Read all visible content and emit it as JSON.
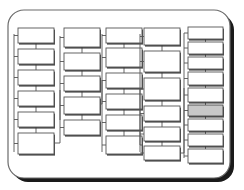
{
  "diagram": {
    "frame": {
      "name": "card-frame",
      "x": 8,
      "y": 10,
      "width": 222,
      "height": 168,
      "corner_radius": 16,
      "fill": "#ffffff",
      "stroke": "#6b6b6b",
      "stroke_width": 1.2,
      "shadow_color": "#1a1a1a",
      "shadow_offset_x": 4,
      "shadow_offset_y": 4
    },
    "style": {
      "box_fill": "#ffffff",
      "box_stroke": "#555555",
      "box_stroke_width": 0.9,
      "box_shadow": "#2b2b2b",
      "connector_stroke": "#555555",
      "connector_width": 0.9,
      "highlight_fill": "#c8c8c8",
      "highlight_stroke": "#4a4a4a"
    },
    "columns": [
      {
        "name": "column-1",
        "trunk": {
          "x": 14,
          "y_top": 34,
          "y_bottom": 152
        },
        "boxes": [
          {
            "id": "c1-b1",
            "x": 18,
            "y": 28,
            "w": 36,
            "h": 15,
            "highlight": false
          },
          {
            "id": "c1-b2",
            "x": 18,
            "y": 49,
            "w": 36,
            "h": 15,
            "highlight": false
          },
          {
            "id": "c1-b3",
            "x": 18,
            "y": 70,
            "w": 36,
            "h": 15,
            "highlight": false
          },
          {
            "id": "c1-b4",
            "x": 18,
            "y": 91,
            "w": 36,
            "h": 15,
            "highlight": false
          },
          {
            "id": "c1-b5",
            "x": 18,
            "y": 112,
            "w": 36,
            "h": 15,
            "highlight": false
          },
          {
            "id": "c1-b6",
            "x": 18,
            "y": 133,
            "w": 36,
            "h": 21,
            "highlight": false
          }
        ],
        "links": [
          {
            "from": "c1-b1",
            "to": "c1-b2"
          },
          {
            "from": "c1-b2",
            "to": "c1-b3"
          },
          {
            "from": "c1-b3",
            "to": "c1-b4"
          },
          {
            "from": "c1-b4",
            "to": "c1-b5"
          },
          {
            "from": "c1-b5",
            "to": "c1-b6"
          }
        ]
      },
      {
        "name": "column-2",
        "trunk": {
          "x": 60,
          "y_top": 36,
          "y_bottom": 120
        },
        "boxes": [
          {
            "id": "c2-b1",
            "x": 64,
            "y": 28,
            "w": 36,
            "h": 19,
            "highlight": false
          },
          {
            "id": "c2-b2",
            "x": 64,
            "y": 53,
            "w": 36,
            "h": 17,
            "highlight": false
          },
          {
            "id": "c2-b3",
            "x": 64,
            "y": 76,
            "w": 36,
            "h": 15,
            "highlight": false
          },
          {
            "id": "c2-b4",
            "x": 64,
            "y": 97,
            "w": 36,
            "h": 17,
            "highlight": false
          },
          {
            "id": "c2-b5",
            "x": 64,
            "y": 120,
            "w": 36,
            "h": 15,
            "highlight": false
          }
        ],
        "links": [
          {
            "from": "c2-b1",
            "to": "c2-b2"
          },
          {
            "from": "c2-b2",
            "to": "c2-b3"
          },
          {
            "from": "c2-b3",
            "to": "c2-b4"
          },
          {
            "from": "c2-b4",
            "to": "c2-b5"
          }
        ]
      },
      {
        "name": "column-3",
        "trunk": {
          "x": 102,
          "y_top": 34,
          "y_bottom": 152
        },
        "boxes": [
          {
            "id": "c3-b1",
            "x": 106,
            "y": 28,
            "w": 36,
            "h": 15,
            "highlight": false
          },
          {
            "id": "c3-b2",
            "x": 106,
            "y": 48,
            "w": 36,
            "h": 19,
            "highlight": false
          },
          {
            "id": "c3-b3",
            "x": 106,
            "y": 73,
            "w": 36,
            "h": 15,
            "highlight": false
          },
          {
            "id": "c3-b4",
            "x": 106,
            "y": 94,
            "w": 36,
            "h": 15,
            "highlight": false
          },
          {
            "id": "c3-b5",
            "x": 106,
            "y": 115,
            "w": 36,
            "h": 15,
            "highlight": false
          },
          {
            "id": "c3-b6",
            "x": 106,
            "y": 136,
            "w": 36,
            "h": 18,
            "highlight": false
          }
        ],
        "links": [
          {
            "from": "c3-b1",
            "to": "c3-b2"
          },
          {
            "from": "c3-b2",
            "to": "c3-b3"
          },
          {
            "from": "c3-b3",
            "to": "c3-b4"
          },
          {
            "from": "c3-b4",
            "to": "c3-b5"
          },
          {
            "from": "c3-b5",
            "to": "c3-b6"
          }
        ]
      },
      {
        "name": "column-4",
        "trunk": {
          "x": 140,
          "y_top": 34,
          "y_bottom": 152
        },
        "boxes": [
          {
            "id": "c4-b1",
            "x": 144,
            "y": 28,
            "w": 36,
            "h": 17,
            "highlight": false
          },
          {
            "id": "c4-b2",
            "x": 144,
            "y": 51,
            "w": 36,
            "h": 21,
            "highlight": false
          },
          {
            "id": "c4-b3",
            "x": 144,
            "y": 78,
            "w": 36,
            "h": 22,
            "highlight": false
          },
          {
            "id": "c4-b4",
            "x": 144,
            "y": 106,
            "w": 36,
            "h": 15,
            "highlight": false
          },
          {
            "id": "c4-b5",
            "x": 144,
            "y": 127,
            "w": 36,
            "h": 14,
            "highlight": false
          },
          {
            "id": "c4-b6",
            "x": 144,
            "y": 146,
            "w": 36,
            "h": 14,
            "highlight": false
          }
        ],
        "links": [
          {
            "from": "c4-b1",
            "to": "c4-b2"
          },
          {
            "from": "c4-b2",
            "to": "c4-b3"
          },
          {
            "from": "c4-b3",
            "to": "c4-b4"
          },
          {
            "from": "c4-b4",
            "to": "c4-b5"
          },
          {
            "from": "c4-b5",
            "to": "c4-b6"
          }
        ]
      },
      {
        "name": "column-5",
        "trunk": {
          "x": 184,
          "y_top": 33,
          "y_bottom": 158
        },
        "boxes": [
          {
            "id": "c5-b1",
            "x": 188,
            "y": 27,
            "w": 35,
            "h": 12,
            "highlight": false
          },
          {
            "id": "c5-b2",
            "x": 188,
            "y": 42,
            "w": 35,
            "h": 12,
            "highlight": false
          },
          {
            "id": "c5-b3",
            "x": 188,
            "y": 57,
            "w": 35,
            "h": 12,
            "highlight": false
          },
          {
            "id": "c5-b4",
            "x": 188,
            "y": 72,
            "w": 35,
            "h": 13,
            "highlight": false
          },
          {
            "id": "c5-b5",
            "x": 188,
            "y": 88,
            "w": 35,
            "h": 14,
            "highlight": false
          },
          {
            "id": "c5-b6",
            "x": 188,
            "y": 105,
            "w": 35,
            "h": 11,
            "highlight": true
          },
          {
            "id": "c5-b7",
            "x": 188,
            "y": 119,
            "w": 35,
            "h": 12,
            "highlight": false
          },
          {
            "id": "c5-b8",
            "x": 188,
            "y": 134,
            "w": 35,
            "h": 12,
            "highlight": false
          },
          {
            "id": "c5-b9",
            "x": 188,
            "y": 149,
            "w": 35,
            "h": 14,
            "highlight": false
          }
        ],
        "links": [
          {
            "from": "c5-b1",
            "to": "c5-b2"
          },
          {
            "from": "c5-b2",
            "to": "c5-b3"
          },
          {
            "from": "c5-b3",
            "to": "c5-b4"
          },
          {
            "from": "c5-b4",
            "to": "c5-b5"
          },
          {
            "from": "c5-b5",
            "to": "c5-b6"
          },
          {
            "from": "c5-b6",
            "to": "c5-b7"
          },
          {
            "from": "c5-b7",
            "to": "c5-b8"
          },
          {
            "from": "c5-b8",
            "to": "c5-b9"
          }
        ]
      }
    ],
    "cross_links": [
      {
        "name": "link-col1-to-col2",
        "from_x": 54,
        "from_y": 143,
        "corner_x": 60,
        "to_y": 90
      },
      {
        "name": "link-col2-to-col3",
        "from_x": 100,
        "from_y": 104,
        "corner_x": 102,
        "to_y": 80
      },
      {
        "name": "link-col3-to-col4",
        "from_x": 142,
        "from_y": 145,
        "corner_x": 140,
        "to_y": 88
      },
      {
        "name": "link-col4-to-col5",
        "from_x": 180,
        "from_y": 153,
        "corner_x": 184,
        "to_y": 88
      }
    ]
  }
}
